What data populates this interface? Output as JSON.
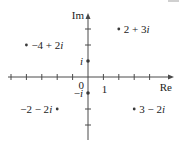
{
  "diagram": {
    "axes": {
      "real_label": "Re",
      "imag_label": "Im",
      "origin_label": "0",
      "unit_real_label": "1",
      "unit_imag_label": "i",
      "neg_unit_imag_label": "−i"
    },
    "layout": {
      "origin_px": [
        88,
        77
      ],
      "unit_x_px": 15.4,
      "unit_y_px": 16,
      "x_axis_extent_px": [
        8,
        174
      ],
      "y_axis_extent_px": [
        13,
        140
      ],
      "x_ticks": [
        -5,
        -4,
        -3,
        -2,
        -1,
        1,
        2,
        3,
        4
      ],
      "y_ticks": [
        3,
        2,
        -2,
        -3
      ],
      "axis_color": "#4a4a4a",
      "point_color": "#3a3a3a",
      "text_color": "#222222"
    },
    "points": [
      {
        "re": 2,
        "im": 3,
        "label": "2 + 3i",
        "label_side": "right"
      },
      {
        "re": -4,
        "im": 2,
        "label": "−4 + 2i",
        "label_side": "right"
      },
      {
        "re": -2,
        "im": -2,
        "label": "−2 − 2i",
        "label_side": "left"
      },
      {
        "re": 3,
        "im": -2,
        "label": "3 − 2i",
        "label_side": "right"
      },
      {
        "re": 0,
        "im": 1,
        "label": "i",
        "label_side": "left"
      },
      {
        "re": 0,
        "im": -1,
        "label": "−i",
        "label_side": "left"
      }
    ]
  }
}
